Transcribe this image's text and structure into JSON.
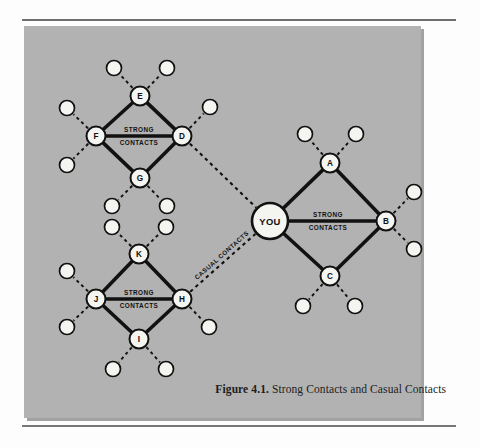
{
  "figure": {
    "caption_number": "Figure 4.1.",
    "caption_text": "Strong Contacts and Casual Contacts"
  },
  "colors": {
    "plate_background": "#b2b2b2",
    "page_background": "#fdfdfd",
    "node_fill": "#f4f4f0",
    "stroke": "#111111",
    "rule": "#6f6f6f"
  },
  "labels": {
    "strong_line1": "STRONG",
    "strong_line2": "CONTACTS",
    "casual": "CASUAL CONTACTS"
  },
  "diagram": {
    "type": "network",
    "center_node": {
      "id": "YOU",
      "label": "YOU",
      "x": 270,
      "y": 221,
      "r": 18
    },
    "nodes": [
      {
        "id": "A",
        "label": "A",
        "x": 330,
        "y": 163,
        "r": 9.5
      },
      {
        "id": "B",
        "label": "B",
        "x": 386,
        "y": 221,
        "r": 9.5
      },
      {
        "id": "C",
        "label": "C",
        "x": 330,
        "y": 276,
        "r": 9.5
      },
      {
        "id": "D",
        "label": "D",
        "x": 182,
        "y": 136,
        "r": 9.5
      },
      {
        "id": "E",
        "label": "E",
        "x": 140,
        "y": 96,
        "r": 9.5
      },
      {
        "id": "F",
        "label": "F",
        "x": 96,
        "y": 136,
        "r": 9.5
      },
      {
        "id": "G",
        "label": "G",
        "x": 140,
        "y": 178,
        "r": 9.5
      },
      {
        "id": "H",
        "label": "H",
        "x": 182,
        "y": 299,
        "r": 9.5
      },
      {
        "id": "I",
        "label": "I",
        "x": 139,
        "y": 339,
        "r": 9.5
      },
      {
        "id": "J",
        "label": "J",
        "x": 96,
        "y": 299,
        "r": 9.5
      },
      {
        "id": "K",
        "label": "K",
        "x": 139,
        "y": 254,
        "r": 9.5
      }
    ],
    "satellites": [
      {
        "owner": "A",
        "x": 305,
        "y": 134,
        "r": 7.5
      },
      {
        "owner": "A",
        "x": 356,
        "y": 134,
        "r": 7.5
      },
      {
        "owner": "B",
        "x": 414,
        "y": 192,
        "r": 7.5
      },
      {
        "owner": "B",
        "x": 414,
        "y": 249,
        "r": 7.5
      },
      {
        "owner": "C",
        "x": 303,
        "y": 306,
        "r": 7.5
      },
      {
        "owner": "C",
        "x": 355,
        "y": 306,
        "r": 7.5
      },
      {
        "owner": "D",
        "x": 210,
        "y": 107,
        "r": 7.5
      },
      {
        "owner": "E",
        "x": 114,
        "y": 68,
        "r": 7.5
      },
      {
        "owner": "E",
        "x": 167,
        "y": 68,
        "r": 7.5
      },
      {
        "owner": "F",
        "x": 67,
        "y": 108,
        "r": 7.5
      },
      {
        "owner": "F",
        "x": 67,
        "y": 165,
        "r": 7.5
      },
      {
        "owner": "G",
        "x": 112,
        "y": 206,
        "r": 7.5
      },
      {
        "owner": "G",
        "x": 167,
        "y": 206,
        "r": 7.5
      },
      {
        "owner": "H",
        "x": 209,
        "y": 327,
        "r": 7.5
      },
      {
        "owner": "I",
        "x": 113,
        "y": 369,
        "r": 7.5
      },
      {
        "owner": "I",
        "x": 166,
        "y": 369,
        "r": 7.5
      },
      {
        "owner": "J",
        "x": 67,
        "y": 271,
        "r": 7.5
      },
      {
        "owner": "J",
        "x": 67,
        "y": 327,
        "r": 7.5
      },
      {
        "owner": "K",
        "x": 112,
        "y": 227,
        "r": 7.5
      },
      {
        "owner": "K",
        "x": 166,
        "y": 227,
        "r": 7.5
      }
    ],
    "strong_edges": [
      {
        "from": "YOU",
        "to": "A"
      },
      {
        "from": "YOU",
        "to": "B"
      },
      {
        "from": "YOU",
        "to": "C"
      },
      {
        "from": "A",
        "to": "B"
      },
      {
        "from": "C",
        "to": "B"
      },
      {
        "from": "F",
        "to": "E"
      },
      {
        "from": "F",
        "to": "D"
      },
      {
        "from": "F",
        "to": "G"
      },
      {
        "from": "E",
        "to": "D"
      },
      {
        "from": "G",
        "to": "D"
      },
      {
        "from": "J",
        "to": "K"
      },
      {
        "from": "J",
        "to": "H"
      },
      {
        "from": "J",
        "to": "I"
      },
      {
        "from": "K",
        "to": "H"
      },
      {
        "from": "I",
        "to": "H"
      }
    ],
    "casual_edges": [
      {
        "from": "D",
        "to": "YOU",
        "label": ""
      },
      {
        "from": "H",
        "to": "YOU",
        "label": "CASUAL CONTACTS"
      }
    ],
    "strong_edge_labels": [
      {
        "on_edge": "YOU-B",
        "x": 328,
        "y": 221
      },
      {
        "on_edge": "F-D",
        "x": 139,
        "y": 136
      },
      {
        "on_edge": "J-H",
        "x": 139,
        "y": 299
      }
    ]
  }
}
